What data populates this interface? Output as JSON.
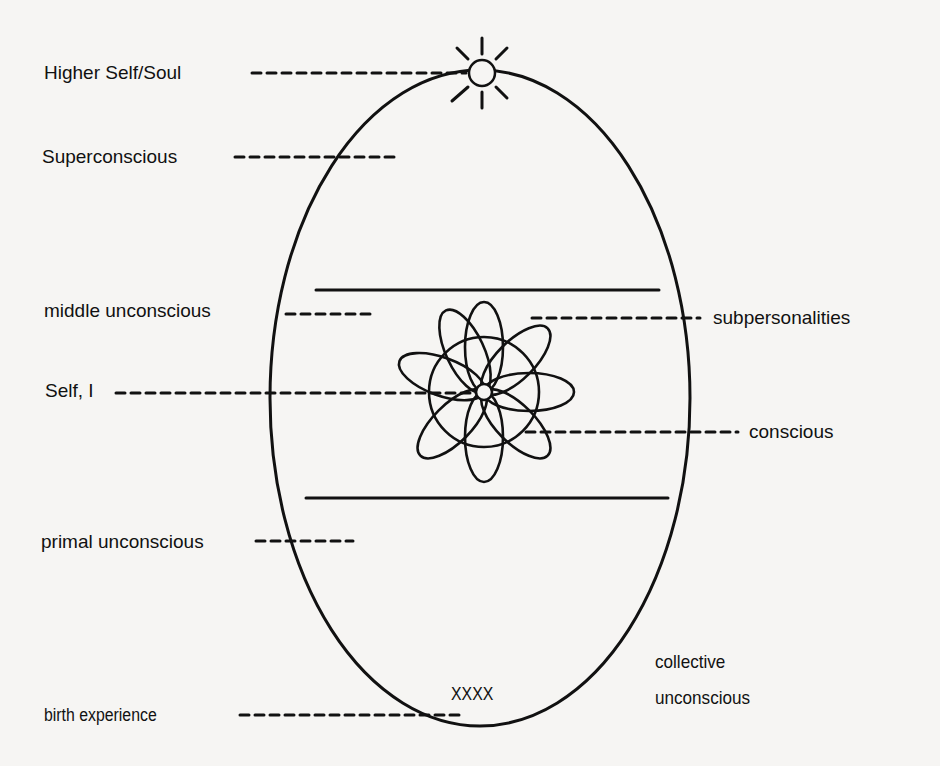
{
  "diagram": {
    "type": "egg-diagram",
    "colors": {
      "background": "#f6f5f3",
      "ink": "#111111"
    },
    "labels": {
      "higher_self": "Higher Self/Soul",
      "superconscious": "Superconscious",
      "middle_unconscious": "middle unconscious",
      "subpersonalities": "subpersonalities",
      "self_i": "Self, I",
      "conscious": "conscious",
      "primal_unconscious": "primal unconscious",
      "birth_experience": "birth experience",
      "birth_marker": "XXXX",
      "collective_line1": "collective",
      "collective_line2": "unconscious"
    },
    "shapes": {
      "egg": {
        "cx": 480,
        "cy": 398,
        "rx": 210,
        "ry": 328
      },
      "sun": {
        "cx": 482,
        "cy": 73,
        "r": 13,
        "rays": 8
      },
      "upper_divider": {
        "x1": 316,
        "x2": 659,
        "y": 290
      },
      "lower_divider": {
        "x1": 306,
        "x2": 668,
        "y": 498
      },
      "flower": {
        "cx": 484,
        "cy": 392,
        "petals": 8,
        "center_r": 8
      }
    }
  }
}
